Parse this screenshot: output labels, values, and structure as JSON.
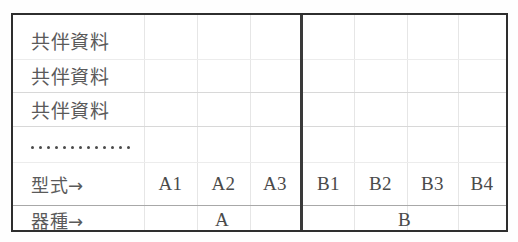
{
  "table": {
    "data_rows": [
      {
        "label": "共伴資料"
      },
      {
        "label": "共伴資料"
      },
      {
        "label": "共伴資料"
      }
    ],
    "ellipsis_dot_count": 13,
    "type_row": {
      "label": "型式→",
      "codes": [
        "A1",
        "A2",
        "A3",
        "B1",
        "B2",
        "B3",
        "B4"
      ]
    },
    "vessel_row": {
      "label": "器種→",
      "groups": [
        "A",
        "B"
      ]
    },
    "colors": {
      "border": "#2e2e2e",
      "divider": "#3a3a3a",
      "grid_light": "#e6e6e6",
      "text": "#4a4a4a",
      "background": "#ffffff"
    }
  }
}
